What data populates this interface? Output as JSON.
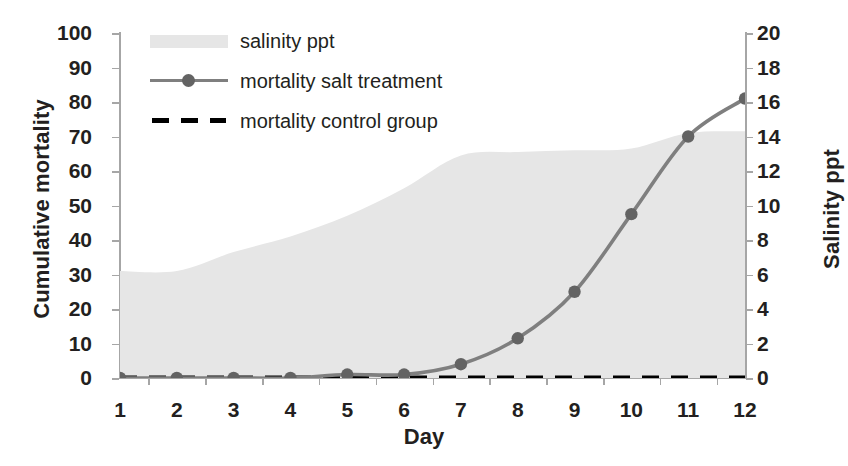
{
  "chart_data": {
    "type": "line",
    "title": "",
    "xlabel": "Day",
    "ylabel": "Cumulative mortality",
    "y2label": "Salinity ppt",
    "x": [
      1,
      2,
      3,
      4,
      5,
      6,
      7,
      8,
      9,
      10,
      11,
      12
    ],
    "xtick_labels": [
      "1",
      "2",
      "3",
      "4",
      "5",
      "6",
      "7",
      "8",
      "9",
      "10",
      "11",
      "12"
    ],
    "ytick_labels_left": [
      "100",
      "90",
      "80",
      "70",
      "60",
      "50",
      "40",
      "30",
      "20",
      "10",
      "0"
    ],
    "ytick_labels_right": [
      "20",
      "18",
      "16",
      "14",
      "12",
      "10",
      "8",
      "6",
      "4",
      "2",
      "0"
    ],
    "ylim": [
      0,
      100
    ],
    "y2lim": [
      0,
      20
    ],
    "xlim": [
      1,
      12
    ],
    "grid": false,
    "legend_position": "upper-left-inside",
    "series": [
      {
        "name": "salinity ppt",
        "axis": "right",
        "style": "area",
        "color": "#e6e6e6",
        "values": [
          6.2,
          6.2,
          7.3,
          8.2,
          9.4,
          11.0,
          12.9,
          13.1,
          13.2,
          13.3,
          14.2,
          14.3
        ]
      },
      {
        "name": "mortality salt treatment",
        "axis": "left",
        "style": "line-marker",
        "color": "#7f7f7f",
        "marker_color": "#636363",
        "values": [
          0,
          0,
          0,
          0,
          1,
          1,
          4,
          11.5,
          25,
          47.5,
          70,
          81
        ]
      },
      {
        "name": "mortality control group",
        "axis": "left",
        "style": "dashed",
        "color": "#000000",
        "values": [
          0,
          0,
          0,
          0,
          0,
          0,
          0,
          0,
          0,
          0,
          0,
          0
        ]
      }
    ],
    "legend_entries": [
      {
        "label": "salinity ppt",
        "swatch": "area-swatch"
      },
      {
        "label": "mortality salt treatment",
        "swatch": "line-marker-swatch"
      },
      {
        "label": "mortality control group",
        "swatch": "dashed-swatch"
      }
    ]
  }
}
